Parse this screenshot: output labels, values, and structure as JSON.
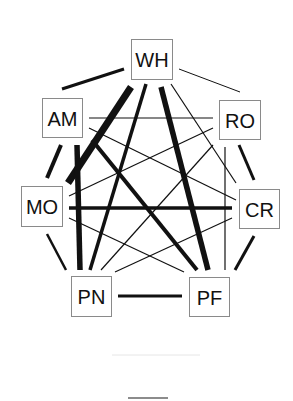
{
  "diagram": {
    "type": "network",
    "layout": "heptagon",
    "colors": {
      "edge": "#111111",
      "node_border": "#8a8a8a",
      "node_fill": "#ffffff",
      "label": "#111111",
      "background": "#ffffff"
    },
    "nodes": [
      {
        "id": "WH",
        "label": "WH",
        "x": 131,
        "y": 39,
        "w": 41,
        "h": 40
      },
      {
        "id": "AM",
        "label": "AM",
        "x": 42,
        "y": 98,
        "w": 40,
        "h": 39
      },
      {
        "id": "RO",
        "label": "RO",
        "x": 219,
        "y": 100,
        "w": 41,
        "h": 39
      },
      {
        "id": "MO",
        "label": "MO",
        "x": 21,
        "y": 186,
        "w": 41,
        "h": 40
      },
      {
        "id": "CR",
        "label": "CR",
        "x": 239,
        "y": 189,
        "w": 40,
        "h": 39
      },
      {
        "id": "PN",
        "label": "PN",
        "x": 71,
        "y": 276,
        "w": 40,
        "h": 40
      },
      {
        "id": "PF",
        "label": "PF",
        "x": 189,
        "y": 277,
        "w": 40,
        "h": 39
      }
    ],
    "edges": [
      {
        "from": "WH",
        "to": "AM",
        "weight": "medium",
        "width": 3,
        "x1": 124,
        "y1": 69,
        "x2": 62,
        "y2": 89
      },
      {
        "from": "WH",
        "to": "RO",
        "weight": "thin",
        "width": 1,
        "x1": 179,
        "y1": 69,
        "x2": 240,
        "y2": 92
      },
      {
        "from": "AM",
        "to": "MO",
        "weight": "thick",
        "width": 4,
        "x1": 61,
        "y1": 145,
        "x2": 47,
        "y2": 178
      },
      {
        "from": "RO",
        "to": "CR",
        "weight": "medium",
        "width": 3,
        "x1": 239,
        "y1": 145,
        "x2": 254,
        "y2": 180
      },
      {
        "from": "MO",
        "to": "PN",
        "weight": "medium",
        "width": 2.5,
        "x1": 47,
        "y1": 234,
        "x2": 66,
        "y2": 270
      },
      {
        "from": "CR",
        "to": "PF",
        "weight": "medium",
        "width": 3,
        "x1": 254,
        "y1": 236,
        "x2": 235,
        "y2": 270
      },
      {
        "from": "PN",
        "to": "PF",
        "weight": "medium",
        "width": 3,
        "x1": 118,
        "y1": 296,
        "x2": 182,
        "y2": 296
      },
      {
        "from": "WH",
        "to": "MO",
        "weight": "very-thick",
        "width": 7,
        "x1": 131,
        "y1": 87,
        "x2": 68,
        "y2": 183
      },
      {
        "from": "WH",
        "to": "PN",
        "weight": "thick",
        "width": 3.5,
        "x1": 146,
        "y1": 84,
        "x2": 90,
        "y2": 270
      },
      {
        "from": "WH",
        "to": "PF",
        "weight": "very-thick",
        "width": 5.5,
        "x1": 161,
        "y1": 87,
        "x2": 208,
        "y2": 270
      },
      {
        "from": "WH",
        "to": "CR",
        "weight": "thin",
        "width": 1.2,
        "x1": 171,
        "y1": 84,
        "x2": 236,
        "y2": 183
      },
      {
        "from": "AM",
        "to": "RO",
        "weight": "thin",
        "width": 1.2,
        "x1": 89,
        "y1": 118,
        "x2": 213,
        "y2": 118
      },
      {
        "from": "AM",
        "to": "CR",
        "weight": "thin",
        "width": 1.2,
        "x1": 89,
        "y1": 128,
        "x2": 236,
        "y2": 200
      },
      {
        "from": "AM",
        "to": "PN",
        "weight": "very-thick",
        "width": 5.5,
        "x1": 77,
        "y1": 145,
        "x2": 80,
        "y2": 270
      },
      {
        "from": "AM",
        "to": "PF",
        "weight": "thick",
        "width": 4,
        "x1": 92,
        "y1": 140,
        "x2": 197,
        "y2": 270
      },
      {
        "from": "RO",
        "to": "MO",
        "weight": "thin",
        "width": 1.2,
        "x1": 213,
        "y1": 128,
        "x2": 69,
        "y2": 196
      },
      {
        "from": "RO",
        "to": "PN",
        "weight": "thin",
        "width": 1.2,
        "x1": 213,
        "y1": 145,
        "x2": 101,
        "y2": 270
      },
      {
        "from": "RO",
        "to": "PF",
        "weight": "thin",
        "width": 1.2,
        "x1": 225,
        "y1": 147,
        "x2": 225,
        "y2": 270
      },
      {
        "from": "MO",
        "to": "CR",
        "weight": "thick",
        "width": 3.5,
        "x1": 69,
        "y1": 208,
        "x2": 232,
        "y2": 208
      },
      {
        "from": "MO",
        "to": "PF",
        "weight": "thin",
        "width": 1.2,
        "x1": 69,
        "y1": 218,
        "x2": 184,
        "y2": 272
      },
      {
        "from": "CR",
        "to": "PN",
        "weight": "thin",
        "width": 1.2,
        "x1": 232,
        "y1": 218,
        "x2": 115,
        "y2": 272
      }
    ],
    "decorations": {
      "faint_line": {
        "x1": 112,
        "y1": 355,
        "x2": 200,
        "y2": 355
      },
      "bottom_rule": {
        "x1": 128,
        "y1": 398,
        "x2": 168,
        "y2": 398
      }
    }
  }
}
